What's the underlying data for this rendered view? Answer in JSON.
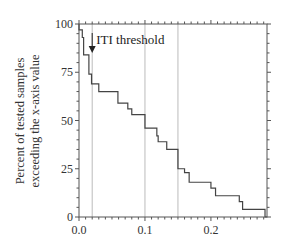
{
  "chart_data": {
    "type": "line",
    "subtype": "step",
    "title": "",
    "xlabel": "",
    "ylabel": [
      "Percent of tested samples",
      "exceeding the x-axis value"
    ],
    "xlim": [
      0.0,
      0.285
    ],
    "ylim": [
      0,
      100
    ],
    "xticks": [
      0.0,
      0.1,
      0.2
    ],
    "xtick_labels": [
      "0.0",
      "0.1",
      "0.2"
    ],
    "yticks": [
      0,
      25,
      50,
      75,
      100
    ],
    "ytick_labels": [
      "0",
      "25",
      "50",
      "75",
      "100"
    ],
    "x_minor_step": 0.01,
    "y_minor_step": 5,
    "grid": false,
    "reference_lines_x": [
      0.02,
      0.1,
      0.15
    ],
    "annotation": {
      "text": "ITI threshold",
      "x": 0.02,
      "arrow": "down"
    },
    "series": [
      {
        "name": "exceedance",
        "steps": [
          {
            "x": 0.0,
            "y": 100
          },
          {
            "x": 0.0,
            "y": 97
          },
          {
            "x": 0.005,
            "y": 93
          },
          {
            "x": 0.007,
            "y": 84
          },
          {
            "x": 0.015,
            "y": 74
          },
          {
            "x": 0.019,
            "y": 69
          },
          {
            "x": 0.03,
            "y": 65
          },
          {
            "x": 0.059,
            "y": 59
          },
          {
            "x": 0.074,
            "y": 56
          },
          {
            "x": 0.08,
            "y": 53
          },
          {
            "x": 0.1,
            "y": 46
          },
          {
            "x": 0.118,
            "y": 42
          },
          {
            "x": 0.12,
            "y": 39
          },
          {
            "x": 0.133,
            "y": 35
          },
          {
            "x": 0.15,
            "y": 25
          },
          {
            "x": 0.16,
            "y": 23
          },
          {
            "x": 0.167,
            "y": 18
          },
          {
            "x": 0.2,
            "y": 15
          },
          {
            "x": 0.207,
            "y": 11
          },
          {
            "x": 0.243,
            "y": 8
          },
          {
            "x": 0.248,
            "y": 4
          },
          {
            "x": 0.282,
            "y": 0
          }
        ]
      }
    ]
  },
  "colors": {
    "axis": "#555555",
    "curve": "#444444",
    "ref_line": "#bbbbbb",
    "text": "#333333"
  }
}
